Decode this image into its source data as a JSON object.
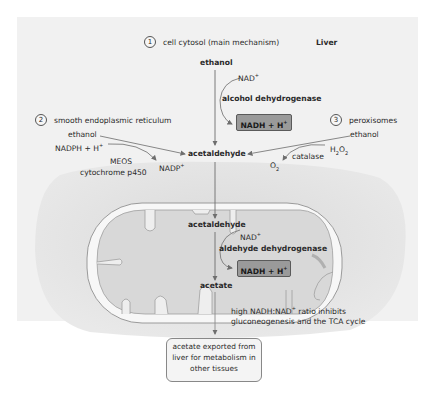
{
  "diagram": {
    "title": "Liver",
    "pathways": [
      {
        "number": "1",
        "label": "cell cytosol (main mechanism)"
      },
      {
        "number": "2",
        "label": "smooth endoplasmic reticulum"
      },
      {
        "number": "3",
        "label": "peroxisomes"
      }
    ],
    "cytosol": {
      "substrate": "ethanol",
      "cofactor_in": "NAD+",
      "enzyme": "alcohol dehydrogenase",
      "product_box": "NADH + H+"
    },
    "er": {
      "substrate": "ethanol",
      "cofactor_in": "NADPH + H+",
      "enzyme_line1": "MEOS",
      "enzyme_line2": "cytochrome p450",
      "cofactor_out": "NADP+"
    },
    "peroxisome": {
      "substrate": "ethanol",
      "cofactor_in": "H2O2",
      "enzyme": "catalase",
      "cofactor_out": "O2"
    },
    "intermediate": "acetaldehyde",
    "mitochondrion": {
      "substrate": "acetaldehyde",
      "cofactor_in": "NAD+",
      "enzyme": "aldehyde dehydrogenase",
      "product_box": "NADH + H+",
      "product": "acetate"
    },
    "note_line1": "high NADH:NAD+ ratio inhibits",
    "note_line2": "gluconeogenesis and the TCA cycle",
    "export_line1": "acetate exported from",
    "export_line2": "liver for metabolism in",
    "export_line3": "other tissues",
    "colors": {
      "panel": "#f1f1f1",
      "cell": "#e0e0e0",
      "mito_fill": "#d6d6d6",
      "box_fill": "#9a9a9a",
      "arrow": "#7a7a7a"
    }
  }
}
